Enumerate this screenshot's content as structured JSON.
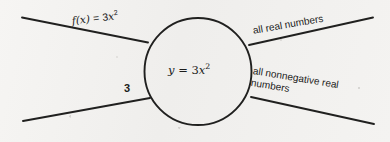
{
  "diagram": {
    "type": "function-machine",
    "title_text": "",
    "background_color": "#f3f2f0",
    "ink_color": "#20201f",
    "machine": {
      "shape": "circle",
      "center_x": 198,
      "center_y": 71,
      "radius": 53,
      "rule_label": "y = 3x2",
      "rule_base": "y",
      "rule_equals": " = 3",
      "rule_var": "x",
      "rule_exponent": "2"
    },
    "inputs": [
      {
        "name": "function-rule",
        "label": "f(x) = 3x2",
        "label_prefix": "f",
        "label_args": "(x)",
        "label_equals": " = 3",
        "label_var": "x",
        "label_exponent": "2",
        "position": "top-left"
      },
      {
        "name": "coefficient",
        "label": "3",
        "position": "bottom-left"
      }
    ],
    "outputs": [
      {
        "name": "domain",
        "label": "all real numbers",
        "position": "top-right"
      },
      {
        "name": "range",
        "label_line1": "all nonnegative real",
        "label_line2": "numbers",
        "position": "bottom-right"
      }
    ],
    "connectors": [
      {
        "name": "input-line-top",
        "x1": 22,
        "y1": 17,
        "x2": 148,
        "y2": 42
      },
      {
        "name": "input-line-bottom",
        "x1": 23,
        "y1": 121,
        "x2": 150,
        "y2": 98
      },
      {
        "name": "output-line-top",
        "x1": 249,
        "y1": 45,
        "x2": 373,
        "y2": 17
      },
      {
        "name": "output-line-bottom",
        "x1": 251,
        "y1": 97,
        "x2": 374,
        "y2": 124
      }
    ]
  }
}
